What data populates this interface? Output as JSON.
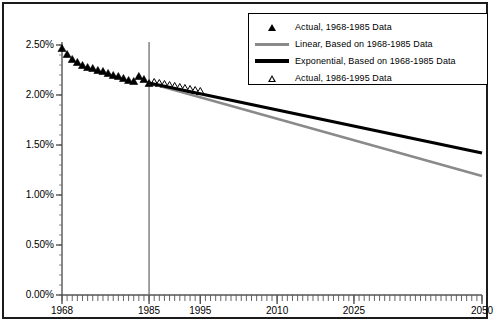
{
  "chart_data": {
    "type": "line",
    "title": "",
    "xlabel": "",
    "ylabel": "",
    "xlim": [
      1968,
      2050
    ],
    "ylim": [
      0.0,
      2.5
    ],
    "grid": false,
    "legend_position": "top-right",
    "y_ticks": [
      "0.00%",
      "0.50%",
      "1.00%",
      "1.50%",
      "2.00%",
      "2.50%"
    ],
    "y_tick_values": [
      0.0,
      0.5,
      1.0,
      1.5,
      2.0,
      2.5
    ],
    "x_ticks": [
      "1968",
      "1985",
      "1995",
      "2010",
      "2025",
      "2050"
    ],
    "x_tick_values": [
      1968,
      1985,
      1995,
      2010,
      2025,
      2050
    ],
    "x_minor_tick_interval": 1,
    "divider_year": 1985,
    "series": [
      {
        "name": "Actual, 1968-1985 Data",
        "marker": "filled-triangle",
        "color": "#000000",
        "x": [
          1968,
          1969,
          1970,
          1971,
          1972,
          1973,
          1974,
          1975,
          1976,
          1977,
          1978,
          1979,
          1980,
          1981,
          1982,
          1983,
          1984,
          1985
        ],
        "values": [
          2.47,
          2.41,
          2.36,
          2.33,
          2.3,
          2.28,
          2.27,
          2.25,
          2.24,
          2.22,
          2.2,
          2.19,
          2.17,
          2.15,
          2.14,
          2.19,
          2.16,
          2.12
        ]
      },
      {
        "name": "Actual, 1986-1995 Data",
        "marker": "open-triangle",
        "color": "#000000",
        "x": [
          1986,
          1987,
          1988,
          1989,
          1990,
          1991,
          1992,
          1993,
          1994,
          1995
        ],
        "values": [
          2.13,
          2.12,
          2.11,
          2.1,
          2.09,
          2.08,
          2.07,
          2.06,
          2.05,
          2.04
        ]
      },
      {
        "name": "Linear, Based on 1968-1985 Data",
        "marker": "line",
        "color": "#8a8a8a",
        "x": [
          1985,
          2050
        ],
        "values": [
          2.12,
          1.19
        ]
      },
      {
        "name": "Exponential, Based on 1968-1985 Data",
        "marker": "line",
        "color": "#000000",
        "x": [
          1985,
          2050
        ],
        "values": [
          2.12,
          1.42
        ]
      }
    ]
  },
  "legend": {
    "items": [
      {
        "label": "Actual, 1968-1985 Data",
        "key": "filled-triangle-icon"
      },
      {
        "label": "Linear, Based on 1968-1985 Data",
        "key": "gray-line-icon"
      },
      {
        "label": "Exponential, Based on 1968-1985 Data",
        "key": "black-line-icon"
      },
      {
        "label": "Actual, 1986-1995 Data",
        "key": "open-triangle-icon"
      }
    ]
  },
  "colors": {
    "linear_line": "#8a8a8a",
    "exponential_line": "#000000",
    "axis": "#555555",
    "frame": "#1b1b1b",
    "divider": "#6e6e6e"
  }
}
